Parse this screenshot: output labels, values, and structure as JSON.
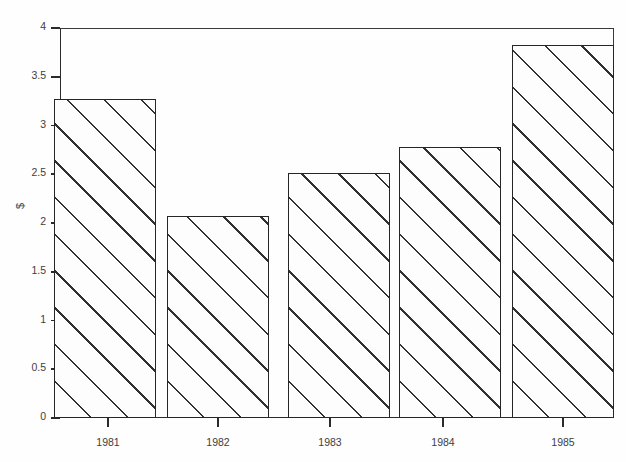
{
  "chart_data": {
    "type": "bar",
    "title": "",
    "subtitle": "",
    "xlabel": "",
    "ylabel": "$",
    "categories": [
      "1981",
      "1982",
      "1983",
      "1984",
      "1985"
    ],
    "values": [
      3.27,
      2.07,
      2.51,
      2.78,
      3.83
    ],
    "series": [
      {
        "name": "",
        "values": [
          3.27,
          2.07,
          2.51,
          2.78,
          3.83
        ]
      }
    ],
    "ylim": [
      0,
      4
    ],
    "ytick_labels": [
      "0",
      "0.5",
      "1",
      "1.5",
      "2",
      "2.5",
      "3",
      "3.5",
      "4"
    ],
    "ytick_values": [
      0,
      0.5,
      1,
      1.5,
      2,
      2.5,
      3,
      3.5,
      4
    ],
    "grid": false,
    "legend": null,
    "legend_position": "none",
    "annotations": [],
    "bar_fill": "diagonal-hatch",
    "bar_edge_color": "#262626",
    "bar_face_color": "#fdfdfd",
    "axis_color": "#2b2b2b",
    "background_color": "#fefefe"
  },
  "axes": {
    "y_label": "$",
    "y_ticks": [
      {
        "label": "4",
        "value": 4.0
      },
      {
        "label": "3.5",
        "value": 3.5
      },
      {
        "label": "3",
        "value": 3.0
      },
      {
        "label": "2.5",
        "value": 2.5
      },
      {
        "label": "2",
        "value": 2.0
      },
      {
        "label": "1.5",
        "value": 1.5
      },
      {
        "label": "1",
        "value": 1.0
      },
      {
        "label": "0.5",
        "value": 0.5
      },
      {
        "label": "0",
        "value": 0.0
      }
    ],
    "x_ticks": [
      {
        "label": "1981"
      },
      {
        "label": "1982"
      },
      {
        "label": "1983"
      },
      {
        "label": "1984"
      },
      {
        "label": "1985"
      }
    ]
  }
}
